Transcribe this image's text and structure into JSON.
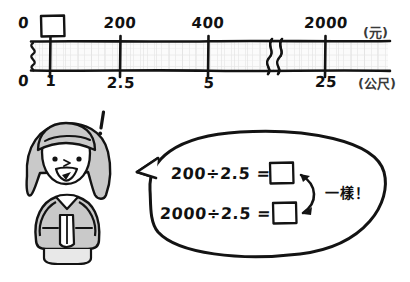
{
  "page": {
    "kind": "hand-drawn math worksheet illustration",
    "background_color": "#ffffff",
    "ink_color": "#1a1a1a",
    "hair_fill_color": "#c9c9c9",
    "bar_fill_color": "#f2f2f2"
  },
  "number_line": {
    "top_unit_label": "(元)",
    "bottom_unit_label": "(公尺)",
    "top_origin": "0",
    "bottom_origin": "0",
    "unknown_box_position": "above-first-tick",
    "break_mark": "zigzag",
    "left_squiggle": "wavy-axis-break",
    "ticks": [
      {
        "top_label": "",
        "bottom_label": "1",
        "x_pct": 9.0
      },
      {
        "top_label": "200",
        "bottom_label": "2.5",
        "x_pct": 29.5
      },
      {
        "top_label": "400",
        "bottom_label": "5",
        "x_pct": 51.0
      },
      {
        "top_label": "2000",
        "bottom_label": "25",
        "x_pct": 79.5
      }
    ]
  },
  "character": {
    "name": "smiling-girl",
    "emotion_mark": "!",
    "pose": "hands-clasped"
  },
  "speech_bubble": {
    "equations": [
      {
        "expression": "200÷2.5 =",
        "answer": ""
      },
      {
        "expression": "2000÷2.5 =",
        "answer": ""
      }
    ],
    "annotation": "一樣！",
    "arrow": "double-headed-curved-arrow"
  }
}
